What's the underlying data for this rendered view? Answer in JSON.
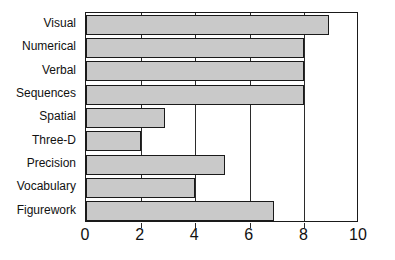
{
  "chart_data": {
    "type": "bar",
    "orientation": "horizontal",
    "title": "",
    "subtitle": "",
    "xlabel": "",
    "ylabel": "",
    "xlim": [
      0,
      10
    ],
    "xticks": [
      "0",
      "2",
      "4",
      "6",
      "8",
      "10"
    ],
    "xtick_values": [
      0,
      2,
      4,
      6,
      8,
      10
    ],
    "grid": "vertical",
    "legend": null,
    "bar_color": "#c9c9c9",
    "bar_edge_color": "#1a1a1a",
    "axis_color": "#1a1a1a",
    "background": "#ffffff",
    "categories": [
      "Visual",
      "Numerical",
      "Verbal",
      "Sequences",
      "Spatial",
      "Three-D",
      "Precision",
      "Vocabulary",
      "Figurework"
    ],
    "values": [
      8.9,
      8.0,
      8.0,
      8.0,
      2.9,
      2.0,
      5.1,
      4.0,
      6.9
    ],
    "bars": [
      {
        "label": "Visual",
        "value": 8.9
      },
      {
        "label": "Numerical",
        "value": 8.0
      },
      {
        "label": "Verbal",
        "value": 8.0
      },
      {
        "label": "Sequences",
        "value": 8.0
      },
      {
        "label": "Spatial",
        "value": 2.9
      },
      {
        "label": "Three-D",
        "value": 2.0
      },
      {
        "label": "Precision",
        "value": 5.1
      },
      {
        "label": "Vocabulary",
        "value": 4.0
      },
      {
        "label": "Figurework",
        "value": 6.9
      }
    ]
  }
}
